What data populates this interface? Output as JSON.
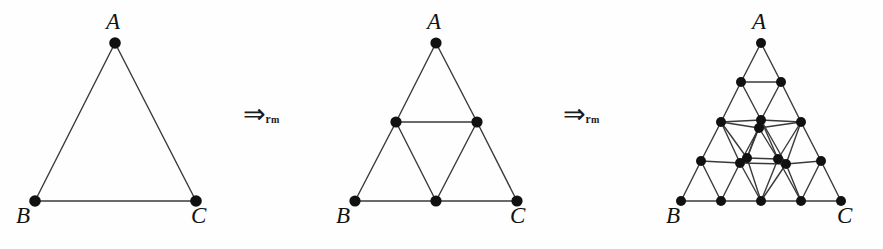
{
  "figure": {
    "background_color": "#fefefe",
    "line_color": "#3a3a3a",
    "node_color": "#111111",
    "label_color": "#121212"
  },
  "arrows": [
    {
      "id": "arrow-1",
      "glyph": "⇒",
      "glyph_name": "double-right-arrow",
      "subscript_main": "r",
      "subscript_sub": "m",
      "meaning": "refine midpoint"
    },
    {
      "id": "arrow-2",
      "glyph": "⇒",
      "glyph_name": "double-right-arrow",
      "subscript_main": "r",
      "subscript_sub": "m",
      "meaning": "refine midpoint"
    }
  ],
  "panels": [
    {
      "id": "panel-1",
      "name": "triangle-level-0",
      "level": 0,
      "labels": {
        "apex": "A",
        "left": "B",
        "right": "C"
      },
      "label_positions": {
        "apex": {
          "x": 106,
          "y": 10
        },
        "left": {
          "x": 16,
          "y": 204
        },
        "right": {
          "x": 191,
          "y": 204
        }
      },
      "nodes": [
        {
          "id": "A",
          "x": 115,
          "y": 43
        },
        {
          "id": "B",
          "x": 35,
          "y": 201
        },
        {
          "id": "C",
          "x": 196,
          "y": 201
        }
      ],
      "edges": [
        [
          "A",
          "B"
        ],
        [
          "A",
          "C"
        ],
        [
          "B",
          "C"
        ]
      ]
    },
    {
      "id": "panel-2",
      "name": "triangle-level-1",
      "level": 1,
      "labels": {
        "apex": "A",
        "left": "B",
        "right": "C"
      },
      "label_positions": {
        "apex": {
          "x": 117,
          "y": 10
        },
        "left": {
          "x": 26,
          "y": 204
        },
        "right": {
          "x": 200,
          "y": 204
        }
      },
      "nodes": [
        {
          "id": "A",
          "x": 126,
          "y": 43
        },
        {
          "id": "B",
          "x": 45,
          "y": 201
        },
        {
          "id": "C",
          "x": 207,
          "y": 201
        },
        {
          "id": "AB",
          "x": 86,
          "y": 122
        },
        {
          "id": "AC",
          "x": 167,
          "y": 122
        },
        {
          "id": "BC",
          "x": 126,
          "y": 201
        }
      ],
      "edges": [
        [
          "A",
          "AB"
        ],
        [
          "AB",
          "B"
        ],
        [
          "A",
          "AC"
        ],
        [
          "AC",
          "C"
        ],
        [
          "B",
          "BC"
        ],
        [
          "BC",
          "C"
        ],
        [
          "AB",
          "AC"
        ],
        [
          "AB",
          "BC"
        ],
        [
          "AC",
          "BC"
        ]
      ]
    },
    {
      "id": "panel-3",
      "name": "triangle-level-2",
      "level": 2,
      "labels": {
        "apex": "A",
        "left": "B",
        "right": "C"
      },
      "label_positions": {
        "apex": {
          "x": 122,
          "y": 10
        },
        "left": {
          "x": 36,
          "y": 204
        },
        "right": {
          "x": 207,
          "y": 204
        }
      },
      "nodes": [
        {
          "id": "n00",
          "x": 131,
          "y": 43
        },
        {
          "id": "n10",
          "x": 111,
          "y": 82
        },
        {
          "id": "n11",
          "x": 151,
          "y": 82
        },
        {
          "id": "n20",
          "x": 91,
          "y": 122
        },
        {
          "id": "n21",
          "x": 131,
          "y": 120
        },
        {
          "id": "n21b",
          "x": 129,
          "y": 128
        },
        {
          "id": "n22",
          "x": 171,
          "y": 122
        },
        {
          "id": "n30",
          "x": 71,
          "y": 161
        },
        {
          "id": "n31",
          "x": 110,
          "y": 163
        },
        {
          "id": "n31b",
          "x": 117,
          "y": 158
        },
        {
          "id": "n32",
          "x": 148,
          "y": 159
        },
        {
          "id": "n32b",
          "x": 156,
          "y": 164
        },
        {
          "id": "n33",
          "x": 191,
          "y": 161
        },
        {
          "id": "n40",
          "x": 51,
          "y": 201
        },
        {
          "id": "n41",
          "x": 91,
          "y": 201
        },
        {
          "id": "n42",
          "x": 131,
          "y": 201
        },
        {
          "id": "n43",
          "x": 171,
          "y": 201
        },
        {
          "id": "n44",
          "x": 211,
          "y": 201
        }
      ],
      "edges": [
        [
          "n00",
          "n10"
        ],
        [
          "n00",
          "n11"
        ],
        [
          "n10",
          "n11"
        ],
        [
          "n10",
          "n20"
        ],
        [
          "n10",
          "n21"
        ],
        [
          "n11",
          "n21"
        ],
        [
          "n11",
          "n22"
        ],
        [
          "n20",
          "n21"
        ],
        [
          "n21",
          "n22"
        ],
        [
          "n20",
          "n21b"
        ],
        [
          "n21b",
          "n22"
        ],
        [
          "n20",
          "n30"
        ],
        [
          "n20",
          "n31"
        ],
        [
          "n20",
          "n31b"
        ],
        [
          "n21",
          "n31b"
        ],
        [
          "n21b",
          "n31b"
        ],
        [
          "n21",
          "n32"
        ],
        [
          "n21b",
          "n32"
        ],
        [
          "n21",
          "n32b"
        ],
        [
          "n21b",
          "n31"
        ],
        [
          "n22",
          "n32"
        ],
        [
          "n22",
          "n32b"
        ],
        [
          "n22",
          "n33"
        ],
        [
          "n30",
          "n31"
        ],
        [
          "n31",
          "n31b"
        ],
        [
          "n31b",
          "n32"
        ],
        [
          "n32",
          "n32b"
        ],
        [
          "n32b",
          "n33"
        ],
        [
          "n31",
          "n32b"
        ],
        [
          "n30",
          "n40"
        ],
        [
          "n30",
          "n41"
        ],
        [
          "n31",
          "n41"
        ],
        [
          "n31b",
          "n42"
        ],
        [
          "n31",
          "n42"
        ],
        [
          "n32",
          "n42"
        ],
        [
          "n32b",
          "n42"
        ],
        [
          "n32",
          "n43"
        ],
        [
          "n32b",
          "n43"
        ],
        [
          "n33",
          "n43"
        ],
        [
          "n33",
          "n44"
        ],
        [
          "n40",
          "n41"
        ],
        [
          "n41",
          "n42"
        ],
        [
          "n42",
          "n43"
        ],
        [
          "n43",
          "n44"
        ]
      ]
    }
  ]
}
